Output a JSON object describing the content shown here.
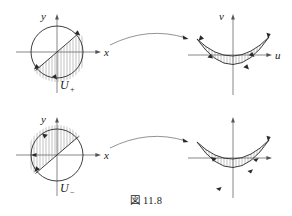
{
  "figure": {
    "caption": "図 11.8",
    "background_color": "#ffffff",
    "line_color": "#2a2a2a",
    "axis_color": "#555555",
    "hatch_color": "#777777"
  },
  "panels": {
    "top_left": {
      "name": "domain-disk-plus",
      "axis_x_label": "x",
      "axis_y_label": "y",
      "set_label": "U",
      "set_subscript": "+",
      "shape": "circle",
      "chord": "lower-left to upper-right",
      "hatch_region": "lower-right",
      "orientation": "clockwise"
    },
    "top_right": {
      "name": "image-crescent-plus",
      "axis_x_label": "u",
      "axis_y_label": "v",
      "shape": "crescent",
      "hatch_region": "interior",
      "orientation": "clockwise"
    },
    "bottom_left": {
      "name": "domain-disk-minus",
      "axis_x_label": "x",
      "axis_y_label": "y",
      "set_label": "U",
      "set_subscript": "−",
      "shape": "circle",
      "chord": "lower-left to upper-right",
      "hatch_region": "upper-left",
      "orientation": "counterclockwise"
    },
    "bottom_right": {
      "name": "image-crescent-minus",
      "axis_x_label": "",
      "axis_y_label": "",
      "shape": "crescent",
      "hatch_region": "interior",
      "orientation": "counterclockwise"
    }
  },
  "arrows": [
    {
      "name": "map-arrow-top",
      "direction": "left-to-right",
      "style": "curved"
    },
    {
      "name": "map-arrow-bottom",
      "direction": "left-to-right",
      "style": "curved"
    }
  ]
}
